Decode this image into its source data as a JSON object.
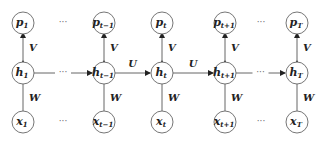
{
  "diagram": {
    "type": "unrolled-rnn",
    "columns": [
      {
        "p": "p",
        "p_sub": "1",
        "h": "h",
        "h_sub": "1",
        "x": "x",
        "x_sub": "1"
      },
      {
        "p": "p",
        "p_sub": "t−1",
        "h": "h",
        "h_sub": "t−1",
        "x": "x",
        "x_sub": "t−1"
      },
      {
        "p": "p",
        "p_sub": "t",
        "h": "h",
        "h_sub": "t",
        "x": "x",
        "x_sub": "t"
      },
      {
        "p": "p",
        "p_sub": "t+1",
        "h": "h",
        "h_sub": "t+1",
        "x": "x",
        "x_sub": "t+1"
      },
      {
        "p": "p",
        "p_sub": "T",
        "h": "h",
        "h_sub": "T",
        "x": "x",
        "x_sub": "T"
      }
    ],
    "weights": {
      "input": "W",
      "output": "V",
      "recurrent": "U"
    },
    "ellipsis": "···"
  }
}
